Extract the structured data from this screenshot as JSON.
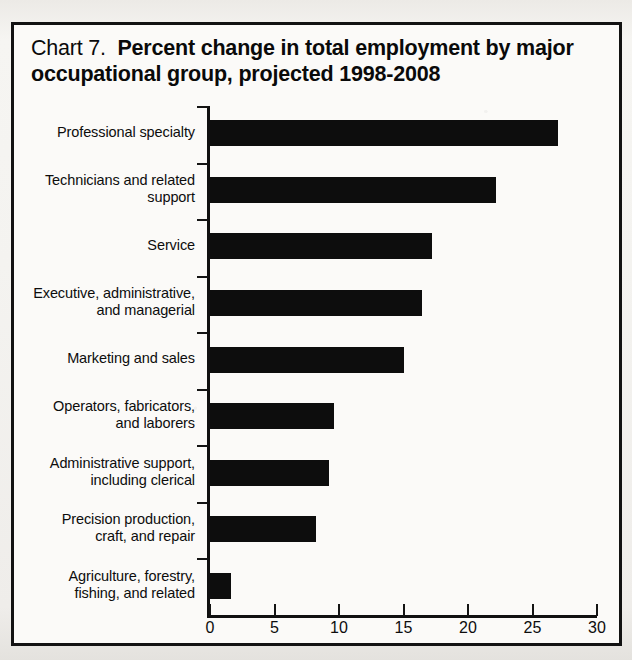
{
  "chart": {
    "title_prefix": "Chart 7.",
    "title_main": "Percent change in total employment by major occupational group, projected 1998-2008"
  },
  "chart_data": {
    "type": "bar",
    "orientation": "horizontal",
    "xlabel": "Percent change",
    "ylabel": "",
    "xlim": [
      0,
      30
    ],
    "xticks": [
      0,
      5,
      10,
      15,
      20,
      25,
      30
    ],
    "xtick_labels": [
      "0",
      "5",
      "10",
      "15",
      "20",
      "25",
      "30"
    ],
    "grid": false,
    "legend": false,
    "bar_color": "#0d0d0d",
    "categories": [
      "Professional specialty",
      "Technicians and related support",
      "Service",
      "Executive, administrative, and managerial",
      "Marketing and sales",
      "Operators, fabricators, and laborers",
      "Administrative support, including clerical",
      "Precision production, craft, and repair",
      "Agriculture, forestry, fishing, and related"
    ],
    "category_lines": [
      [
        "Professional specialty"
      ],
      [
        "Technicians and related",
        "support"
      ],
      [
        "Service"
      ],
      [
        "Executive, administrative,",
        "and managerial"
      ],
      [
        "Marketing and sales"
      ],
      [
        "Operators, fabricators,",
        "and laborers"
      ],
      [
        "Administrative support,",
        "including clerical"
      ],
      [
        "Precision production,",
        "craft, and repair"
      ],
      [
        "Agriculture, forestry,",
        "fishing, and related"
      ]
    ],
    "values": [
      27.0,
      22.2,
      17.2,
      16.4,
      15.0,
      9.6,
      9.2,
      8.2,
      1.6
    ]
  }
}
